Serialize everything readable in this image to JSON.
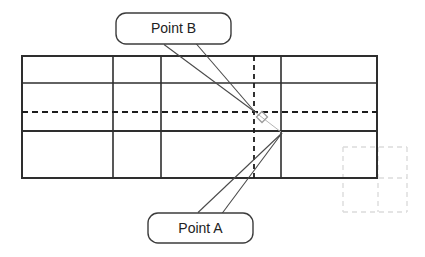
{
  "diagram": {
    "callout_b_label": "Point B",
    "callout_a_label": "Point A"
  },
  "colors": {
    "background": "#ffffff",
    "grid_line": "#2e2e2e",
    "dashed_line": "#1c1c1c",
    "ghost_grid": "#dcdcdc",
    "leader_line": "#4a4a4a",
    "callout_border": "#3c3c3c",
    "callout_fill": "#ffffff",
    "marker": "#9c9c9c",
    "marker_connector": "#b5b5b5",
    "text": "#222222"
  }
}
